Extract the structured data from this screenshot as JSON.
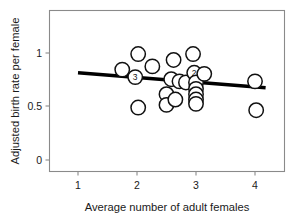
{
  "chart_data": {
    "type": "scatter",
    "title": "",
    "xlabel": "Average number of adult females",
    "ylabel": "Adjusted birth rate per female",
    "xlim": [
      0.5,
      4.55
    ],
    "ylim": [
      -0.08,
      1.3
    ],
    "xticks": [
      1,
      2,
      3,
      4
    ],
    "xtick_labels": [
      "1",
      "2",
      "3",
      "4"
    ],
    "yticks": [
      0,
      0.5,
      1
    ],
    "ytick_labels": [
      "0",
      "0.5",
      "1"
    ],
    "grid": false,
    "legend": null,
    "points": [
      {
        "x": 1.75,
        "y": 0.845,
        "n": 1,
        "label": ""
      },
      {
        "x": 1.97,
        "y": 0.775,
        "n": 3,
        "label": "3"
      },
      {
        "x": 2.02,
        "y": 0.99,
        "n": 1,
        "label": ""
      },
      {
        "x": 2.02,
        "y": 0.49,
        "n": 1,
        "label": ""
      },
      {
        "x": 2.26,
        "y": 0.875,
        "n": 1,
        "label": ""
      },
      {
        "x": 2.5,
        "y": 0.615,
        "n": 1,
        "label": ""
      },
      {
        "x": 2.5,
        "y": 0.515,
        "n": 1,
        "label": ""
      },
      {
        "x": 2.58,
        "y": 0.755,
        "n": 1,
        "label": ""
      },
      {
        "x": 2.62,
        "y": 0.935,
        "n": 1,
        "label": ""
      },
      {
        "x": 2.65,
        "y": 0.565,
        "n": 1,
        "label": ""
      },
      {
        "x": 2.72,
        "y": 0.735,
        "n": 1,
        "label": ""
      },
      {
        "x": 2.83,
        "y": 0.725,
        "n": 1,
        "label": ""
      },
      {
        "x": 2.95,
        "y": 0.99,
        "n": 1,
        "label": ""
      },
      {
        "x": 2.97,
        "y": 0.815,
        "n": 2,
        "label": "2"
      },
      {
        "x": 3.0,
        "y": 0.725,
        "n": 1,
        "label": ""
      },
      {
        "x": 3.0,
        "y": 0.665,
        "n": 1,
        "label": ""
      },
      {
        "x": 3.0,
        "y": 0.615,
        "n": 1,
        "label": ""
      },
      {
        "x": 3.0,
        "y": 0.565,
        "n": 1,
        "label": ""
      },
      {
        "x": 3.0,
        "y": 0.525,
        "n": 1,
        "label": ""
      },
      {
        "x": 3.14,
        "y": 0.805,
        "n": 1,
        "label": ""
      },
      {
        "x": 4.0,
        "y": 0.735,
        "n": 1,
        "label": ""
      },
      {
        "x": 4.02,
        "y": 0.465,
        "n": 1,
        "label": ""
      }
    ],
    "fit_line": {
      "x_start": 1.0,
      "y_start": 0.815,
      "x_end": 4.18,
      "y_end": 0.675
    },
    "marker": {
      "shape": "circle-open",
      "radius_px": 7.2,
      "edge_color": "#111111",
      "face_color": "#ffffff"
    },
    "colors": {
      "line": "#000000",
      "frame": "#8a8a8a",
      "text": "#1a1a1a",
      "background": "#ffffff"
    }
  }
}
